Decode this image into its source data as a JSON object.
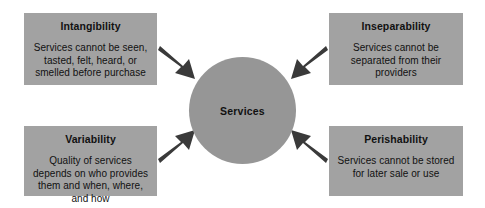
{
  "diagram": {
    "center": {
      "label": "Services",
      "shape": "circle",
      "fill": "#969696"
    },
    "box_fill": "#a2a2a2",
    "arrow_color": "#3a3a3a",
    "background": "#ffffff",
    "boxes": [
      {
        "id": "intangibility",
        "title": "Intangibility",
        "body": "Services cannot be seen, tasted, felt, heard, or smelled before purchase",
        "position": "top-left"
      },
      {
        "id": "inseparability",
        "title": "Inseparability",
        "body": "Services cannot be separated from their providers",
        "position": "top-right"
      },
      {
        "id": "variability",
        "title": "Variability",
        "body": "Quality of services depends on who provides them and when, where, and how",
        "position": "bottom-left"
      },
      {
        "id": "perishability",
        "title": "Perishability",
        "body": "Services cannot be stored for later sale or use",
        "position": "bottom-right"
      }
    ],
    "arrows": [
      {
        "id": "arrow-intangibility-to-services",
        "from": "intangibility",
        "to": "services",
        "direction": "down-right"
      },
      {
        "id": "arrow-inseparability-to-services",
        "from": "inseparability",
        "to": "services",
        "direction": "down-left"
      },
      {
        "id": "arrow-variability-to-services",
        "from": "variability",
        "to": "services",
        "direction": "up-right"
      },
      {
        "id": "arrow-perishability-to-services",
        "from": "perishability",
        "to": "services",
        "direction": "up-left"
      }
    ]
  }
}
